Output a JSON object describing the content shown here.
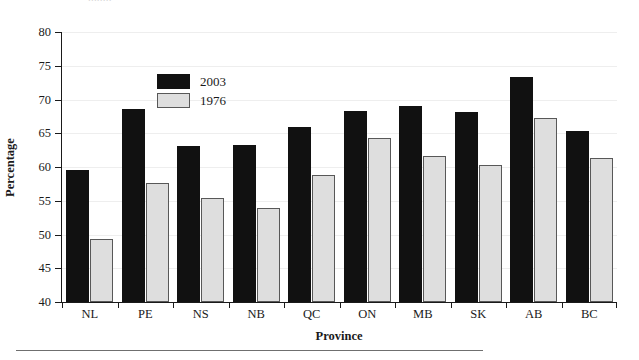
{
  "page": {
    "clipped_header_text": "........",
    "bottom_rule": "horizontal-rule"
  },
  "colors": {
    "series_2003": "#111111",
    "series_1976": "#dedede",
    "series_1976_border": "#585858",
    "axis": "#1a1a1a",
    "gridline": "#eeeeee",
    "background": "#ffffff"
  },
  "legend": {
    "position": "top-left-inside",
    "entries": [
      {
        "label": "2003",
        "swatch": "black-filled-square"
      },
      {
        "label": "1976",
        "swatch": "light-gray-outlined-square"
      }
    ]
  },
  "chart_data": {
    "type": "bar",
    "title": "",
    "subtitle": "",
    "xlabel": "Province",
    "ylabel": "Percentage",
    "ylim": [
      40,
      80
    ],
    "yticks": [
      40,
      45,
      50,
      55,
      60,
      65,
      70,
      75,
      80
    ],
    "ytick_labels": [
      "40",
      "45",
      "50",
      "55",
      "60",
      "65",
      "70",
      "75",
      "80"
    ],
    "grid": true,
    "grid_axis": "y",
    "legend": [
      "2003",
      "1976"
    ],
    "legend_position": "upper left",
    "categories": [
      "NL",
      "PE",
      "NS",
      "NB",
      "QC",
      "ON",
      "MB",
      "SK",
      "AB",
      "BC"
    ],
    "series": [
      {
        "name": "2003",
        "color": "#111111",
        "values": [
          59.5,
          68.6,
          63.1,
          63.3,
          65.9,
          68.3,
          69.0,
          68.1,
          73.3,
          65.3
        ]
      },
      {
        "name": "1976",
        "color": "#dedede",
        "values": [
          49.4,
          57.7,
          55.4,
          53.9,
          58.8,
          64.3,
          61.6,
          60.3,
          67.3,
          61.4
        ]
      }
    ],
    "annotations": []
  }
}
